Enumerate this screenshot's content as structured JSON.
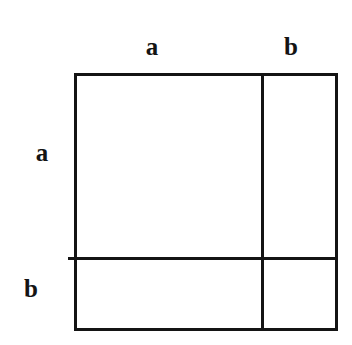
{
  "diagram": {
    "kind": "geometric-square-partition",
    "background_color": "#ffffff",
    "line_color": "#141414",
    "line_width_px": 3,
    "labels": {
      "top_left_segment": "a",
      "top_right_segment": "b",
      "left_upper_segment": "a",
      "left_lower_segment": "b"
    },
    "geometry": {
      "outer_square": {
        "x": 74,
        "y": 73,
        "width": 263,
        "height": 257
      },
      "vertical_divider_x": 262,
      "horizontal_divider_y": 258,
      "horizontal_divider_x_start": 68,
      "horizontal_divider_x_end": 337,
      "regions": [
        {
          "name": "top-left",
          "width_label": "a",
          "height_label": "a"
        },
        {
          "name": "top-right",
          "width_label": "b",
          "height_label": "a"
        },
        {
          "name": "bottom-left",
          "width_label": "a",
          "height_label": "b"
        },
        {
          "name": "bottom-right",
          "width_label": "b",
          "height_label": "b"
        }
      ]
    }
  }
}
